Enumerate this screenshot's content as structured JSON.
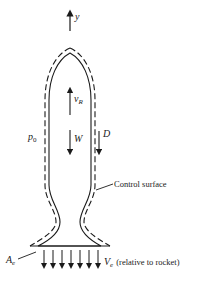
{
  "diagram": {
    "axis": {
      "label": "y"
    },
    "labels": {
      "velocity": "v",
      "velocity_sub": "R",
      "weight": "W",
      "drag": "D",
      "pressure": "p",
      "pressure_sub": "0",
      "control_surface": "Control surface",
      "exit_area": "A",
      "exit_area_sub": "e",
      "exit_velocity": "V",
      "exit_velocity_sub": "e",
      "exit_velocity_note": "(relative to rocket)"
    },
    "colors": {
      "line": "#1a1a1a",
      "background": "#ffffff"
    },
    "exhaust_arrow_count": 7
  }
}
